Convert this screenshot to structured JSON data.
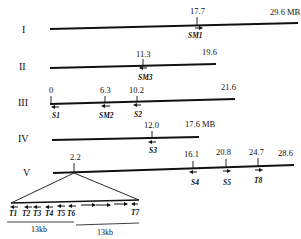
{
  "unit": "MB",
  "chromosomes": [
    {
      "name": "I",
      "length_label": "29.6 MB",
      "y": 29,
      "x1": 50,
      "x2": 298,
      "markers": [
        {
          "pos": "17.7",
          "x": 197,
          "gene": "SM1",
          "dir": "right"
        }
      ]
    },
    {
      "name": "II",
      "length_label": "19.6",
      "y": 67,
      "x1": 50,
      "x2": 216,
      "markers": [
        {
          "pos": "11.3",
          "x": 143,
          "gene": "SM3",
          "dir": "left"
        }
      ]
    },
    {
      "name": "III",
      "length_label": "21.6",
      "y": 103,
      "x1": 50,
      "x2": 235,
      "markers": [
        {
          "pos": "0",
          "x": 51,
          "gene": "S1",
          "dir": "left"
        },
        {
          "pos": "6.3",
          "x": 105,
          "gene": "SM2",
          "dir": "left"
        },
        {
          "pos": "10.2",
          "x": 137,
          "gene": "S2",
          "dir": "left"
        }
      ]
    },
    {
      "name": "IV",
      "length_label": "17.6 MB",
      "y": 139,
      "x1": 52,
      "x2": 199,
      "markers": [
        {
          "pos": "12.0",
          "x": 152,
          "gene": "S3",
          "dir": "left"
        }
      ]
    },
    {
      "name": "V",
      "length_label": "28.6",
      "y": 172,
      "x1": 53,
      "x2": 294,
      "markers": [
        {
          "pos": "2.2",
          "x": 74,
          "gene": "",
          "dir": ""
        },
        {
          "pos": "16.1",
          "x": 193,
          "gene": "S4",
          "dir": "left"
        },
        {
          "pos": "20.8",
          "x": 226,
          "gene": "S5",
          "dir": "right"
        },
        {
          "pos": "24.7",
          "x": 258,
          "gene": "T8",
          "dir": "right"
        }
      ]
    }
  ],
  "inset": {
    "source_chromosome": "V",
    "source_pos": "2.2",
    "genes": [
      {
        "label": "T1",
        "dir": "left"
      },
      {
        "label": "T2",
        "dir": "left"
      },
      {
        "label": "T3",
        "dir": "left"
      },
      {
        "label": "T4",
        "dir": "left"
      },
      {
        "label": "T5",
        "dir": "left"
      },
      {
        "label": "T6",
        "dir": "left"
      },
      {
        "label": "",
        "dir": "right"
      },
      {
        "label": "",
        "dir": "right"
      },
      {
        "label": "",
        "dir": "right"
      },
      {
        "label": "T7",
        "dir": "left"
      }
    ],
    "scale_bars": [
      "13kb",
      "13kb"
    ]
  }
}
